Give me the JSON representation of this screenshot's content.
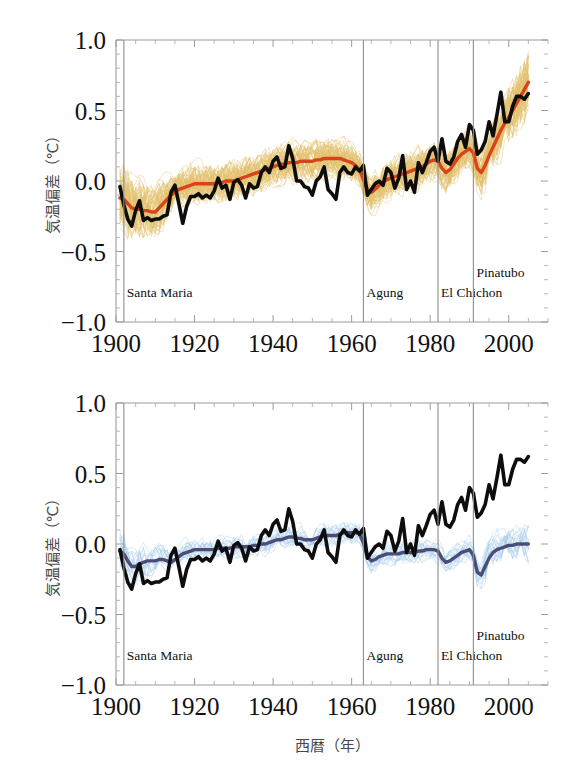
{
  "figure": {
    "background_color": "#ffffff",
    "width": 579,
    "height": 783
  },
  "axes": {
    "ylabel": "気温偏差（℃）",
    "xlabel": "西暦（年）",
    "x_ticks": [
      "1900",
      "1920",
      "1940",
      "1960",
      "1980",
      "2000"
    ],
    "y_ticks": [
      "1.0",
      "0.5",
      "0.0",
      "−0.5",
      "−1.0"
    ],
    "xlim": [
      1900,
      2010
    ],
    "ylim": [
      -1.0,
      1.0
    ],
    "x_tick_values": [
      1900,
      1920,
      1940,
      1960,
      1980,
      2000
    ],
    "y_tick_values": [
      1.0,
      0.5,
      0.0,
      -0.5,
      -1.0
    ],
    "x_minor_step": 5,
    "y_minor_step": 0.1,
    "frame_color": "#9c9c9c",
    "tick_color": "#9c9c9c"
  },
  "volcano_events": [
    {
      "name": "Santa Maria",
      "year": 1902,
      "label_row": 0
    },
    {
      "name": "Agung",
      "year": 1963,
      "label_row": 0
    },
    {
      "name": "El Chichon",
      "year": 1982,
      "label_row": 0
    },
    {
      "name": "Pinatubo",
      "year": 1991,
      "label_row": 1
    }
  ],
  "panels": [
    {
      "id": "panel-top",
      "name": "anthropogenic-and-natural-forcings",
      "ensemble_color": "#E3C06A",
      "ensemble_opacity": 0.55,
      "mean_color": "#D8431B",
      "observed_color": "#0d0d0d",
      "ensemble_members": 58,
      "ensemble_spread": 0.135
    },
    {
      "id": "panel-bottom",
      "name": "natural-forcings-only",
      "ensemble_color": "#9FC8E6",
      "ensemble_opacity": 0.5,
      "mean_color": "#4C4C78",
      "observed_color": "#0d0d0d",
      "ensemble_members": 19,
      "ensemble_spread": 0.085
    }
  ],
  "chart_data": {
    "type": "line",
    "title": "",
    "xlabel": "西暦（年）",
    "ylabel": "気温偏差（℃）",
    "xlim": [
      1900,
      2010
    ],
    "ylim": [
      -1.0,
      1.0
    ],
    "grid": false,
    "legend_position": "none",
    "annotations": [
      {
        "text": "Santa Maria",
        "x": 1902,
        "y": -0.82
      },
      {
        "text": "Agung",
        "x": 1963,
        "y": -0.82
      },
      {
        "text": "El Chichon",
        "x": 1982,
        "y": -0.82
      },
      {
        "text": "Pinatubo",
        "x": 1991,
        "y": -0.68
      }
    ],
    "x": [
      1901,
      1902,
      1903,
      1904,
      1905,
      1906,
      1907,
      1908,
      1909,
      1910,
      1911,
      1912,
      1913,
      1914,
      1915,
      1916,
      1917,
      1918,
      1919,
      1920,
      1921,
      1922,
      1923,
      1924,
      1925,
      1926,
      1927,
      1928,
      1929,
      1930,
      1931,
      1932,
      1933,
      1934,
      1935,
      1936,
      1937,
      1938,
      1939,
      1940,
      1941,
      1942,
      1943,
      1944,
      1945,
      1946,
      1947,
      1948,
      1949,
      1950,
      1951,
      1952,
      1953,
      1954,
      1955,
      1956,
      1957,
      1958,
      1959,
      1960,
      1961,
      1962,
      1963,
      1964,
      1965,
      1966,
      1967,
      1968,
      1969,
      1970,
      1971,
      1972,
      1973,
      1974,
      1975,
      1976,
      1977,
      1978,
      1979,
      1980,
      1981,
      1982,
      1983,
      1984,
      1985,
      1986,
      1987,
      1988,
      1989,
      1990,
      1991,
      1992,
      1993,
      1994,
      1995,
      1996,
      1997,
      1998,
      1999,
      2000,
      2001,
      2002,
      2003,
      2004,
      2005
    ],
    "series": [
      {
        "name": "観測 (observed)",
        "panel": "both",
        "color": "#0d0d0d",
        "values": [
          -0.04,
          -0.17,
          -0.27,
          -0.32,
          -0.21,
          -0.14,
          -0.28,
          -0.26,
          -0.28,
          -0.27,
          -0.27,
          -0.25,
          -0.24,
          -0.08,
          -0.03,
          -0.16,
          -0.3,
          -0.18,
          -0.11,
          -0.11,
          -0.09,
          -0.12,
          -0.1,
          -0.12,
          -0.07,
          0.02,
          -0.05,
          -0.03,
          -0.13,
          -0.01,
          0.01,
          -0.03,
          -0.12,
          -0.02,
          -0.05,
          -0.04,
          0.06,
          0.1,
          0.06,
          0.14,
          0.17,
          0.09,
          0.1,
          0.25,
          0.16,
          0.0,
          0.0,
          -0.04,
          -0.05,
          -0.1,
          0.0,
          0.03,
          0.1,
          -0.06,
          -0.09,
          -0.13,
          0.06,
          0.1,
          0.06,
          0.05,
          0.1,
          0.07,
          0.11,
          -0.1,
          -0.06,
          -0.02,
          0.0,
          -0.03,
          0.09,
          0.06,
          -0.05,
          0.02,
          0.18,
          -0.06,
          0.0,
          -0.08,
          0.13,
          0.06,
          0.13,
          0.21,
          0.24,
          0.14,
          0.3,
          0.14,
          0.12,
          0.17,
          0.28,
          0.33,
          0.24,
          0.4,
          0.36,
          0.19,
          0.22,
          0.28,
          0.42,
          0.32,
          0.47,
          0.63,
          0.42,
          0.42,
          0.53,
          0.6,
          0.6,
          0.58,
          0.62
        ]
      },
      {
        "name": "全強制力モデル平均 (all forcings, multi-model mean)",
        "panel": "top",
        "color": "#D8431B",
        "values": [
          -0.12,
          -0.13,
          -0.16,
          -0.19,
          -0.2,
          -0.2,
          -0.21,
          -0.21,
          -0.22,
          -0.22,
          -0.19,
          -0.16,
          -0.13,
          -0.1,
          -0.08,
          -0.06,
          -0.05,
          -0.04,
          -0.03,
          -0.02,
          -0.02,
          -0.02,
          -0.02,
          -0.02,
          -0.02,
          -0.01,
          -0.01,
          0.0,
          0.0,
          0.0,
          0.01,
          0.02,
          0.03,
          0.04,
          0.05,
          0.06,
          0.07,
          0.08,
          0.09,
          0.1,
          0.11,
          0.12,
          0.12,
          0.13,
          0.13,
          0.13,
          0.14,
          0.14,
          0.14,
          0.14,
          0.15,
          0.15,
          0.16,
          0.16,
          0.16,
          0.16,
          0.16,
          0.15,
          0.14,
          0.13,
          0.11,
          0.08,
          0.01,
          -0.06,
          -0.08,
          -0.06,
          -0.03,
          -0.01,
          0.01,
          0.02,
          0.03,
          0.04,
          0.05,
          0.06,
          0.07,
          0.08,
          0.09,
          0.1,
          0.12,
          0.14,
          0.15,
          0.14,
          0.09,
          0.06,
          0.08,
          0.12,
          0.16,
          0.19,
          0.21,
          0.23,
          0.2,
          0.09,
          0.06,
          0.11,
          0.18,
          0.24,
          0.3,
          0.36,
          0.41,
          0.45,
          0.5,
          0.55,
          0.6,
          0.65,
          0.7
        ]
      },
      {
        "name": "自然強制力のみモデル平均 (natural forcings only, multi-model mean)",
        "panel": "bottom",
        "color": "#4C4C78",
        "values": [
          -0.05,
          -0.07,
          -0.12,
          -0.16,
          -0.16,
          -0.14,
          -0.13,
          -0.12,
          -0.12,
          -0.12,
          -0.11,
          -0.11,
          -0.12,
          -0.13,
          -0.11,
          -0.09,
          -0.07,
          -0.06,
          -0.05,
          -0.04,
          -0.04,
          -0.04,
          -0.04,
          -0.04,
          -0.04,
          -0.03,
          -0.03,
          -0.03,
          -0.03,
          -0.02,
          -0.02,
          -0.02,
          -0.02,
          -0.02,
          -0.01,
          -0.01,
          0.0,
          0.0,
          0.01,
          0.02,
          0.03,
          0.03,
          0.04,
          0.05,
          0.05,
          0.04,
          0.04,
          0.03,
          0.03,
          0.03,
          0.04,
          0.05,
          0.06,
          0.06,
          0.06,
          0.06,
          0.07,
          0.08,
          0.08,
          0.08,
          0.08,
          0.07,
          0.01,
          -0.09,
          -0.12,
          -0.11,
          -0.09,
          -0.08,
          -0.07,
          -0.07,
          -0.07,
          -0.07,
          -0.06,
          -0.06,
          -0.06,
          -0.06,
          -0.05,
          -0.05,
          -0.04,
          -0.04,
          -0.04,
          -0.05,
          -0.1,
          -0.13,
          -0.12,
          -0.1,
          -0.08,
          -0.06,
          -0.05,
          -0.04,
          -0.08,
          -0.2,
          -0.22,
          -0.16,
          -0.1,
          -0.06,
          -0.04,
          -0.03,
          -0.02,
          -0.01,
          -0.01,
          0.0,
          0.0,
          0.0,
          0.0
        ]
      }
    ]
  }
}
